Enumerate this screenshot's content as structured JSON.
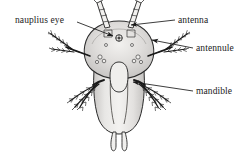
{
  "figure": {
    "kind": "labeled-biology-diagram",
    "background_color": "#ffffff",
    "ink_color": "#1a1a1a",
    "body_fill": "#d9d7d5",
    "body_fill_light": "#efeeec",
    "body_fill_mid": "#c9c7c5",
    "outline_color": "#2b2b2b"
  },
  "labels": [
    {
      "id": "nauplius-eye",
      "text": "nauplius eye",
      "side": "left",
      "x": 15,
      "y": 16,
      "leader": {
        "from_x": 77,
        "from_y": 22,
        "to_x": 113,
        "to_y": 36,
        "arrow": true
      }
    },
    {
      "id": "antenna",
      "text": "antenna",
      "side": "right",
      "x": 178,
      "y": 16,
      "leader": {
        "from_x": 175,
        "from_y": 20,
        "to_x": 131,
        "to_y": 25,
        "arrow": true
      }
    },
    {
      "id": "antennule",
      "text": "antennule",
      "side": "right",
      "x": 196,
      "y": 44,
      "leader": {
        "from_x": 193,
        "from_y": 48,
        "to_x": 152,
        "to_y": 40,
        "arrow": true
      }
    },
    {
      "id": "mandible",
      "text": "mandible",
      "side": "right",
      "x": 196,
      "y": 87,
      "leader": {
        "from_x": 193,
        "from_y": 91,
        "to_x": 133,
        "to_y": 82,
        "arrow": true
      }
    }
  ],
  "anatomy": {
    "carapace": "broad shield-shaped head region",
    "trunk": "elongate tapering abdomen",
    "caudal_rami": 2,
    "antennae": 2,
    "antennules": 2,
    "mandibles": 2,
    "eye_label": "median nauplius eye"
  }
}
